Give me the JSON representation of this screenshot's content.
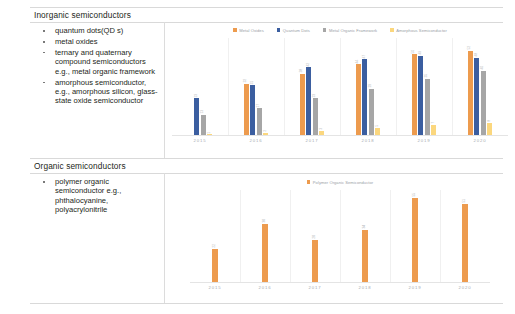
{
  "document": {
    "rows": [
      {
        "title": "Inorganic semiconductors",
        "bullets": [
          "quantum dots(QD s)",
          "metal oxides",
          "ternary and quaternary compound semiconductors e.g., metal organic framework",
          "amorphous semiconductor, e.g., amorphous silicon, glass-state oxide semiconductor"
        ]
      },
      {
        "title": "Organic semiconductors",
        "bullets": [
          "polymer organic semiconductor e.g., phthalocyanine, polyacrylonitrile"
        ]
      }
    ]
  },
  "colors": {
    "orange": "#ED9B4E",
    "blue": "#3B5EA0",
    "gray": "#A6A6A6",
    "yellow": "#FBD77E",
    "axis": "#E4E4E4",
    "label": "#A7ABAF",
    "border": "#D9D9D9"
  },
  "chart_data": [
    {
      "type": "bar",
      "title": "",
      "xlabel": "",
      "ylabel": "",
      "grid": false,
      "legend_position": "top",
      "categories": [
        "2015",
        "2016",
        "2017",
        "2018",
        "2019",
        "2020"
      ],
      "ylim": [
        0,
        60
      ],
      "series": [
        {
          "name": "Metal Oxides",
          "color": "#ED9B4E",
          "values": [
            0,
            32,
            38,
            44,
            50,
            52
          ]
        },
        {
          "name": "Quantum Dots",
          "color": "#3B5EA0",
          "values": [
            23,
            31,
            42,
            47,
            49,
            48
          ]
        },
        {
          "name": "Metal Organic Framework",
          "color": "#A6A6A6",
          "values": [
            13,
            17,
            23,
            29,
            35,
            40
          ]
        },
        {
          "name": "Amorphous Semiconductor",
          "color": "#FBD77E",
          "values": [
            1,
            2,
            3,
            5,
            7,
            8
          ]
        }
      ]
    },
    {
      "type": "bar",
      "title": "",
      "xlabel": "",
      "ylabel": "",
      "grid": false,
      "legend_position": "top",
      "categories": [
        "2015",
        "2016",
        "2017",
        "2018",
        "2019",
        "2020"
      ],
      "ylim": [
        0,
        60
      ],
      "series": [
        {
          "name": "Polymer Organic Semiconductor",
          "color": "#ED9B4E",
          "values": [
            22,
            38,
            28,
            34,
            55,
            51
          ]
        }
      ]
    }
  ]
}
